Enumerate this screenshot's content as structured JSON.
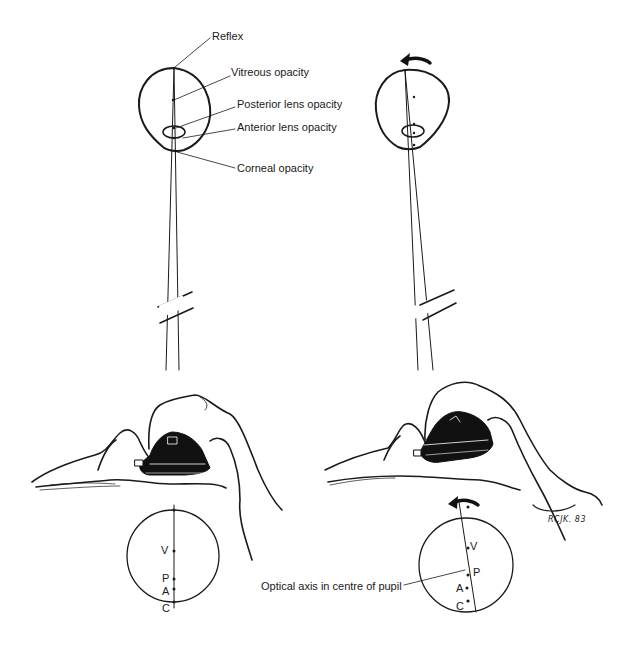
{
  "figure": {
    "left_panel": {
      "labels": {
        "reflex": "Reflex",
        "vitreous": "Vitreous opacity",
        "posterior_lens": "Posterior lens opacity",
        "anterior_lens": "Anterior lens opacity",
        "corneal": "Corneal opacity"
      },
      "pupil_view": {
        "points": [
          "V",
          "P",
          "A",
          "C"
        ]
      }
    },
    "right_panel": {
      "rotation_arrow": "counter-clockwise",
      "pupil_view": {
        "points": [
          "V",
          "P",
          "A",
          "C"
        ],
        "annotation": "Optical axis in centre of pupil"
      }
    },
    "signature": "RCJK. 83",
    "colors": {
      "ink": "#1a1a1a",
      "background": "#ffffff",
      "instrument": "#111111"
    }
  }
}
